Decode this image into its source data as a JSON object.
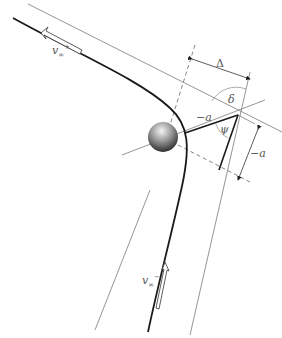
{
  "diagram": {
    "labels": {
      "v_out": "v",
      "v_out_sub": "∞",
      "v_out_sup": "+",
      "v_in": "v",
      "v_in_sub": "∞",
      "v_in_sup": "−",
      "delta_big": "Δ",
      "delta": "δ",
      "psi": "ψ",
      "minus_a_top": "−a",
      "minus_a_right": "−a"
    },
    "colors": {
      "trajectory": "#1a1a1a",
      "thin_line": "#7a7a7a",
      "dashed": "#666666",
      "label": "#555555",
      "planet_light": "#e8e8e8",
      "planet_dark": "#222222"
    },
    "geometry": {
      "focus_intersection": [
        238,
        115
      ],
      "planet_center": [
        163,
        137
      ],
      "planet_radius": 15
    }
  }
}
